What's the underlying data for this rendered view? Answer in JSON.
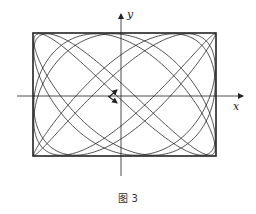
{
  "figure": {
    "caption": "图 3",
    "x_axis_label": "x",
    "y_axis_label": "y",
    "stroke_color": "#222222",
    "background": "#ffffff"
  },
  "geometry": {
    "box": {
      "left": 33,
      "top": 33,
      "right": 216,
      "bottom": 156
    },
    "origin": {
      "x": 121,
      "y": 96
    },
    "x_axis": {
      "from": 17,
      "to": 243
    },
    "y_axis": {
      "from": 176,
      "to": 14
    }
  },
  "curve": {
    "type": "lissajous",
    "x_freq": 5,
    "y_freq": 7,
    "phase": 0.35,
    "samples": 1800,
    "turns": 1
  },
  "direction_arrows": [
    {
      "name": "arrow-up-left",
      "x1": 109,
      "y1": 97,
      "x2": 117,
      "y2": 90
    },
    {
      "name": "arrow-down-right",
      "x1": 108,
      "y1": 96,
      "x2": 117,
      "y2": 103
    }
  ]
}
